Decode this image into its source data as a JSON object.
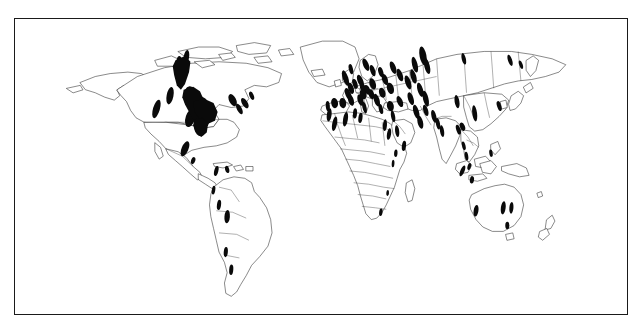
{
  "figure": {
    "kind": "world-distribution-map",
    "title": "",
    "caption": "",
    "background_color": "#ffffff",
    "frame_color": "#1a1a1a",
    "coastline_color": "#2b2b2b",
    "country_border_color": "#3a3a3a",
    "marker_color": "#0a0a0a",
    "projection": "equirectangular",
    "lon_range": [
      -180,
      180
    ],
    "lat_range": [
      -60,
      84
    ],
    "legend_present": false,
    "axis_labels_present": false,
    "graticule_visible": false
  },
  "chart_data": {
    "type": "scatter",
    "title": "",
    "xlabel": "",
    "ylabel": "",
    "projection": "equirectangular",
    "xlim": [
      -180,
      180
    ],
    "ylim": [
      -60,
      84
    ],
    "grid": false,
    "legend": null,
    "marker_shape": "filled-ellipse",
    "marker_color": "#0a0a0a",
    "series": [
      {
        "name": "Occurrence records",
        "note": "Filled black patches indicating recorded distribution",
        "points": [
          {
            "region": "British Columbia / Alberta",
            "x": 244,
            "y": 70,
            "rx": 6.5,
            "ry": 20,
            "rot": -8
          },
          {
            "region": "Northwest Territories",
            "x": 252,
            "y": 52,
            "rx": 4,
            "ry": 10,
            "rot": 10
          },
          {
            "region": "Pacific Northwest USA",
            "x": 228,
            "y": 104,
            "rx": 5,
            "ry": 12,
            "rot": 12
          },
          {
            "region": "California coast",
            "x": 208,
            "y": 122,
            "rx": 5,
            "ry": 13,
            "rot": 18
          },
          {
            "region": "Northern Rockies",
            "x": 258,
            "y": 106,
            "rx": 10,
            "ry": 15,
            "rot": -5
          },
          {
            "region": "Central Rockies",
            "x": 272,
            "y": 122,
            "rx": 14,
            "ry": 17,
            "rot": 0
          },
          {
            "region": "Colorado Plateau",
            "x": 258,
            "y": 134,
            "rx": 7,
            "ry": 13,
            "rot": 20
          },
          {
            "region": "Southern Rockies",
            "x": 272,
            "y": 146,
            "rx": 9,
            "ry": 13,
            "rot": -10
          },
          {
            "region": "Great Lakes region",
            "x": 320,
            "y": 110,
            "rx": 5,
            "ry": 9,
            "rot": -30
          },
          {
            "region": "Northeast USA",
            "x": 338,
            "y": 114,
            "rx": 4,
            "ry": 8,
            "rot": -35
          },
          {
            "region": "Appalachians",
            "x": 330,
            "y": 122,
            "rx": 3.5,
            "ry": 8,
            "rot": -30
          },
          {
            "region": "Quebec",
            "x": 348,
            "y": 104,
            "rx": 3,
            "ry": 6,
            "rot": -25
          },
          {
            "region": "Central Mexico",
            "x": 250,
            "y": 176,
            "rx": 5,
            "ry": 11,
            "rot": 25
          },
          {
            "region": "Guatemala highlands",
            "x": 262,
            "y": 192,
            "rx": 3,
            "ry": 5,
            "rot": 20
          },
          {
            "region": "Colombia Andes",
            "x": 296,
            "y": 206,
            "rx": 3,
            "ry": 7,
            "rot": 15
          },
          {
            "region": "Venezuela",
            "x": 312,
            "y": 204,
            "rx": 3,
            "ry": 5,
            "rot": -15
          },
          {
            "region": "Ecuador",
            "x": 292,
            "y": 232,
            "rx": 2.5,
            "ry": 6,
            "rot": 10
          },
          {
            "region": "Peru",
            "x": 300,
            "y": 252,
            "rx": 3,
            "ry": 7,
            "rot": 8
          },
          {
            "region": "Bolivia",
            "x": 312,
            "y": 268,
            "rx": 4,
            "ry": 9,
            "rot": 5
          },
          {
            "region": "Northern Argentina",
            "x": 310,
            "y": 316,
            "rx": 3,
            "ry": 7,
            "rot": 5
          },
          {
            "region": "Patagonia",
            "x": 318,
            "y": 340,
            "rx": 3,
            "ry": 7,
            "rot": 5
          },
          {
            "region": "Ireland / Britain",
            "x": 486,
            "y": 80,
            "rx": 4,
            "ry": 11,
            "rot": -20
          },
          {
            "region": "Scotland",
            "x": 494,
            "y": 68,
            "rx": 3,
            "ry": 7,
            "rot": -15
          },
          {
            "region": "Norway",
            "x": 516,
            "y": 62,
            "rx": 4,
            "ry": 9,
            "rot": -25
          },
          {
            "region": "Sweden",
            "x": 526,
            "y": 70,
            "rx": 3.5,
            "ry": 8,
            "rot": -20
          },
          {
            "region": "Denmark / N Germany",
            "x": 508,
            "y": 84,
            "rx": 4,
            "ry": 9,
            "rot": -25
          },
          {
            "region": "Netherlands",
            "x": 500,
            "y": 88,
            "rx": 3.5,
            "ry": 7,
            "rot": -20
          },
          {
            "region": "Belgium / N France",
            "x": 494,
            "y": 94,
            "rx": 4,
            "ry": 8,
            "rot": -20
          },
          {
            "region": "Central France",
            "x": 490,
            "y": 102,
            "rx": 4,
            "ry": 9,
            "rot": -25
          },
          {
            "region": "S France",
            "x": 494,
            "y": 110,
            "rx": 4,
            "ry": 8,
            "rot": -20
          },
          {
            "region": "Pyrenees",
            "x": 482,
            "y": 114,
            "rx": 5,
            "ry": 7,
            "rot": -10
          },
          {
            "region": "N Spain",
            "x": 470,
            "y": 114,
            "rx": 5,
            "ry": 7,
            "rot": -12
          },
          {
            "region": "Portugal",
            "x": 460,
            "y": 118,
            "rx": 3,
            "ry": 7,
            "rot": -5
          },
          {
            "region": "S Germany",
            "x": 512,
            "y": 94,
            "rx": 4,
            "ry": 8,
            "rot": -25
          },
          {
            "region": "Poland",
            "x": 526,
            "y": 88,
            "rx": 4.5,
            "ry": 8,
            "rot": -20
          },
          {
            "region": "Czechia",
            "x": 518,
            "y": 96,
            "rx": 4,
            "ry": 7,
            "rot": -22
          },
          {
            "region": "Austria / Alps",
            "x": 512,
            "y": 102,
            "rx": 5,
            "ry": 7,
            "rot": -15
          },
          {
            "region": "Hungary",
            "x": 524,
            "y": 102,
            "rx": 4,
            "ry": 7,
            "rot": -20
          },
          {
            "region": "N Italy",
            "x": 508,
            "y": 110,
            "rx": 4,
            "ry": 8,
            "rot": -20
          },
          {
            "region": "Italy peninsula",
            "x": 514,
            "y": 120,
            "rx": 3,
            "ry": 8,
            "rot": -15
          },
          {
            "region": "Balkans",
            "x": 532,
            "y": 110,
            "rx": 4,
            "ry": 9,
            "rot": -20
          },
          {
            "region": "Greece",
            "x": 538,
            "y": 122,
            "rx": 3,
            "ry": 7,
            "rot": -15
          },
          {
            "region": "Romania",
            "x": 540,
            "y": 100,
            "rx": 4.5,
            "ry": 7,
            "rot": -20
          },
          {
            "region": "Ukraine",
            "x": 552,
            "y": 94,
            "rx": 5,
            "ry": 8,
            "rot": -20
          },
          {
            "region": "Belarus",
            "x": 544,
            "y": 82,
            "rx": 4,
            "ry": 8,
            "rot": -22
          },
          {
            "region": "Baltic states",
            "x": 538,
            "y": 72,
            "rx": 3.5,
            "ry": 7,
            "rot": -20
          },
          {
            "region": "NW Russia",
            "x": 556,
            "y": 66,
            "rx": 4,
            "ry": 9,
            "rot": -22
          },
          {
            "region": "Moscow region",
            "x": 566,
            "y": 76,
            "rx": 4,
            "ry": 9,
            "rot": -22
          },
          {
            "region": "Volga region",
            "x": 578,
            "y": 86,
            "rx": 4,
            "ry": 10,
            "rot": -20
          },
          {
            "region": "Urals north",
            "x": 588,
            "y": 62,
            "rx": 4,
            "ry": 11,
            "rot": -15
          },
          {
            "region": "Urals south",
            "x": 586,
            "y": 78,
            "rx": 4,
            "ry": 10,
            "rot": -18
          },
          {
            "region": "W Siberia north",
            "x": 600,
            "y": 50,
            "rx": 5,
            "ry": 13,
            "rot": -12
          },
          {
            "region": "W Siberia",
            "x": 606,
            "y": 64,
            "rx": 4,
            "ry": 11,
            "rot": -15
          },
          {
            "region": "Kazakhstan north",
            "x": 596,
            "y": 96,
            "rx": 4,
            "ry": 10,
            "rot": -18
          },
          {
            "region": "Kazakhstan",
            "x": 604,
            "y": 108,
            "rx": 4,
            "ry": 11,
            "rot": -15
          },
          {
            "region": "Caspian region",
            "x": 582,
            "y": 108,
            "rx": 4,
            "ry": 9,
            "rot": -20
          },
          {
            "region": "Caucasus",
            "x": 566,
            "y": 112,
            "rx": 4,
            "ry": 8,
            "rot": -25
          },
          {
            "region": "Turkey",
            "x": 552,
            "y": 118,
            "rx": 5,
            "ry": 7,
            "rot": -15
          },
          {
            "region": "Levant",
            "x": 556,
            "y": 132,
            "rx": 3,
            "ry": 8,
            "rot": -12
          },
          {
            "region": "Iran north",
            "x": 590,
            "y": 126,
            "rx": 4,
            "ry": 10,
            "rot": -18
          },
          {
            "region": "Iran",
            "x": 596,
            "y": 140,
            "rx": 4,
            "ry": 9,
            "rot": -15
          },
          {
            "region": "Turkmenistan",
            "x": 604,
            "y": 124,
            "rx": 3.5,
            "ry": 8,
            "rot": -18
          },
          {
            "region": "Afghanistan",
            "x": 616,
            "y": 132,
            "rx": 3.5,
            "ry": 9,
            "rot": -15
          },
          {
            "region": "Morocco",
            "x": 462,
            "y": 130,
            "rx": 3.5,
            "ry": 9,
            "rot": 8
          },
          {
            "region": "Atlas Mountains",
            "x": 470,
            "y": 142,
            "rx": 3.5,
            "ry": 10,
            "rot": 12
          },
          {
            "region": "Algeria",
            "x": 486,
            "y": 136,
            "rx": 3.5,
            "ry": 10,
            "rot": 10
          },
          {
            "region": "Tunisia",
            "x": 500,
            "y": 128,
            "rx": 3,
            "ry": 7,
            "rot": 5
          },
          {
            "region": "Libya coast",
            "x": 508,
            "y": 134,
            "rx": 3,
            "ry": 7,
            "rot": 8
          },
          {
            "region": "Egypt / Nile",
            "x": 544,
            "y": 144,
            "rx": 3,
            "ry": 8,
            "rot": 5
          },
          {
            "region": "Red Sea west",
            "x": 550,
            "y": 156,
            "rx": 3,
            "ry": 8,
            "rot": 10
          },
          {
            "region": "Arabian peninsula",
            "x": 562,
            "y": 152,
            "rx": 3,
            "ry": 8,
            "rot": -8
          },
          {
            "region": "Yemen",
            "x": 572,
            "y": 172,
            "rx": 3,
            "ry": 7,
            "rot": 8
          },
          {
            "region": "Ethiopia",
            "x": 560,
            "y": 182,
            "rx": 2.5,
            "ry": 5,
            "rot": 5
          },
          {
            "region": "East Africa",
            "x": 556,
            "y": 196,
            "rx": 2,
            "ry": 5,
            "rot": 5
          },
          {
            "region": "Zimbabwe",
            "x": 548,
            "y": 236,
            "rx": 2,
            "ry": 4,
            "rot": 5
          },
          {
            "region": "South Africa Cape",
            "x": 538,
            "y": 262,
            "rx": 2.5,
            "ry": 5,
            "rot": 8
          },
          {
            "region": "Pakistan",
            "x": 622,
            "y": 142,
            "rx": 3,
            "ry": 8,
            "rot": -12
          },
          {
            "region": "NW India",
            "x": 628,
            "y": 152,
            "rx": 3,
            "ry": 8,
            "rot": -10
          },
          {
            "region": "NE India",
            "x": 652,
            "y": 150,
            "rx": 3,
            "ry": 7,
            "rot": -20
          },
          {
            "region": "Himalaya east",
            "x": 658,
            "y": 146,
            "rx": 3.5,
            "ry": 6,
            "rot": -25
          },
          {
            "region": "Xinjiang",
            "x": 650,
            "y": 112,
            "rx": 3.5,
            "ry": 9,
            "rot": -10
          },
          {
            "region": "Central China",
            "x": 676,
            "y": 128,
            "rx": 3.5,
            "ry": 11,
            "rot": -8
          },
          {
            "region": "Korea / Japan",
            "x": 712,
            "y": 118,
            "rx": 3,
            "ry": 7,
            "rot": -20
          },
          {
            "region": "NE Siberia",
            "x": 728,
            "y": 56,
            "rx": 3,
            "ry": 8,
            "rot": -20
          },
          {
            "region": "Kamchatka",
            "x": 744,
            "y": 62,
            "rx": 2.5,
            "ry": 6,
            "rot": -20
          },
          {
            "region": "Central Siberia",
            "x": 660,
            "y": 54,
            "rx": 3,
            "ry": 8,
            "rot": -15
          },
          {
            "region": "Myanmar",
            "x": 660,
            "y": 172,
            "rx": 2.5,
            "ry": 6,
            "rot": -15
          },
          {
            "region": "Thailand",
            "x": 664,
            "y": 186,
            "rx": 2.5,
            "ry": 6,
            "rot": -10
          },
          {
            "region": "Sumatra",
            "x": 658,
            "y": 206,
            "rx": 3,
            "ry": 8,
            "rot": 25
          },
          {
            "region": "Java",
            "x": 672,
            "y": 218,
            "rx": 3,
            "ry": 5,
            "rot": 10
          },
          {
            "region": "Malaysia",
            "x": 668,
            "y": 200,
            "rx": 2.5,
            "ry": 5,
            "rot": 15
          },
          {
            "region": "Philippines",
            "x": 700,
            "y": 182,
            "rx": 2.5,
            "ry": 5,
            "rot": -10
          },
          {
            "region": "SW Australia",
            "x": 678,
            "y": 260,
            "rx": 3.5,
            "ry": 8,
            "rot": 10
          },
          {
            "region": "SE Australia inland",
            "x": 718,
            "y": 256,
            "rx": 3.5,
            "ry": 9,
            "rot": 8
          },
          {
            "region": "NSW Australia",
            "x": 730,
            "y": 256,
            "rx": 3,
            "ry": 8,
            "rot": 5
          },
          {
            "region": "Tasmania / Victoria",
            "x": 724,
            "y": 280,
            "rx": 3,
            "ry": 5,
            "rot": 0
          }
        ]
      }
    ],
    "summary": {
      "total_marked_regions": 98,
      "highest_density_continent": "Europe",
      "lowest_density_continent": "Sub-Saharan Africa",
      "continents_with_records": [
        "North America",
        "South America",
        "Europe",
        "Africa",
        "Asia",
        "Australia"
      ],
      "continents_without_records": [
        "Antarctica"
      ]
    }
  }
}
